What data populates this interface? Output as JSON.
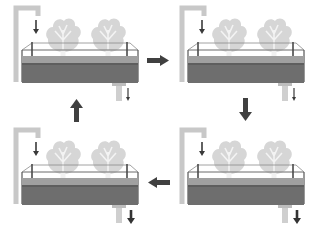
{
  "diagram": {
    "type": "cycle",
    "colors": {
      "pipe": "#c9c9c9",
      "tank_water": "#6f6f6f",
      "water_surface": "#a3a3a3",
      "frame": "#4a4a4a",
      "plant_leaf": "#d9d9d9",
      "plant_vein": "#f2f2f2",
      "arrow": "#404040",
      "background": "#ffffff"
    },
    "panels": [
      {
        "id": "stage-1",
        "position": "top-left",
        "inflow_arrow": "down",
        "drain_arrow": "small-down",
        "plants": 2
      },
      {
        "id": "stage-2",
        "position": "top-right",
        "inflow_arrow": "down",
        "drain_arrow": "small-down",
        "plants": 2
      },
      {
        "id": "stage-3",
        "position": "bottom-right",
        "inflow_arrow": "down",
        "drain_arrow": "large-down",
        "plants": 2
      },
      {
        "id": "stage-4",
        "position": "bottom-left",
        "inflow_arrow": "down",
        "drain_arrow": "large-down",
        "plants": 2
      }
    ],
    "flow_arrows": [
      {
        "from": "stage-1",
        "to": "stage-2",
        "direction": "right"
      },
      {
        "from": "stage-2",
        "to": "stage-3",
        "direction": "down"
      },
      {
        "from": "stage-3",
        "to": "stage-4",
        "direction": "left"
      },
      {
        "from": "stage-4",
        "to": "stage-1",
        "direction": "up"
      }
    ]
  }
}
